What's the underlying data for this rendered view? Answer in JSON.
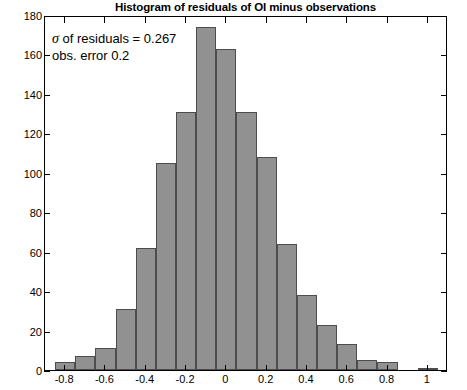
{
  "chart_data": {
    "type": "bar",
    "title": "Histogram of residuals of OI minus observations",
    "xlabel": "",
    "ylabel": "",
    "xlim": [
      -0.9,
      1.1
    ],
    "ylim": [
      0,
      180
    ],
    "grid": false,
    "legend": null,
    "bar_color": "#919191",
    "bar_edge_color": "#4d4d4d",
    "bin_width": 0.1,
    "bin_centers": [
      -0.8,
      -0.7,
      -0.6,
      -0.5,
      -0.4,
      -0.3,
      -0.2,
      -0.1,
      0.0,
      0.1,
      0.2,
      0.3,
      0.4,
      0.5,
      0.6,
      0.7,
      0.8,
      0.9,
      1.0
    ],
    "bin_edges": [
      -0.85,
      -0.75,
      -0.65,
      -0.55,
      -0.45,
      -0.35,
      -0.25,
      -0.15,
      -0.05,
      0.05,
      0.15,
      0.25,
      0.35,
      0.45,
      0.55,
      0.65,
      0.75,
      0.85,
      0.95,
      1.05
    ],
    "values": [
      4,
      7,
      11,
      31,
      62,
      105,
      131,
      174,
      163,
      131,
      108,
      64,
      38,
      23,
      13,
      5,
      4,
      0,
      1
    ],
    "xticks": [
      -0.8,
      -0.6,
      -0.4,
      -0.2,
      0,
      0.2,
      0.4,
      0.6,
      0.8,
      1
    ],
    "xtick_labels": [
      "-0.8",
      "-0.6",
      "-0.4",
      "-0.2",
      "0",
      "0.2",
      "0.4",
      "0.6",
      "0.8",
      "1"
    ],
    "yticks": [
      0,
      20,
      40,
      60,
      80,
      100,
      120,
      140,
      160,
      180
    ],
    "ytick_labels": [
      "0",
      "20",
      "40",
      "60",
      "80",
      "100",
      "120",
      "140",
      "160",
      "180"
    ],
    "annotations": [
      {
        "sigma_symbol": "σ",
        "text": " of residuals = 0.267"
      },
      {
        "sigma_symbol": "",
        "text": "obs. error 0.2"
      }
    ]
  }
}
